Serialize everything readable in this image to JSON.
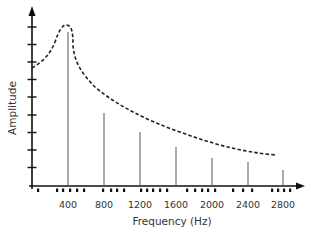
{
  "chart_data": {
    "type": "line",
    "title": "",
    "xlabel": "Frequency (Hz)",
    "ylabel": "Amplitude",
    "xticks": [
      400,
      800,
      1200,
      1600,
      2000,
      2400,
      2800
    ],
    "xtick_labels": [
      "400",
      "800",
      "1200",
      "1600",
      "2000",
      "2400",
      "2800"
    ],
    "y_tick_count": 9,
    "y_tick_labels": [],
    "grid": false,
    "legend": null,
    "series": [
      {
        "name": "envelope",
        "style": "dashed",
        "description": "Resonance envelope curve peaking near 400 Hz and decaying toward higher frequencies",
        "x": [
          0,
          100,
          200,
          300,
          360,
          400,
          440,
          500,
          600,
          800,
          1000,
          1200,
          1600,
          2000,
          2400,
          2700
        ],
        "y": [
          6.8,
          7.2,
          7.9,
          8.7,
          9.1,
          9.1,
          8.3,
          6.9,
          5.6,
          4.3,
          3.6,
          3.1,
          2.4,
          1.9,
          1.6,
          1.5
        ]
      },
      {
        "name": "harmonics",
        "style": "stem",
        "description": "Vertical lines at harmonic frequencies (multiples of 400 Hz)",
        "x": [
          400,
          800,
          1200,
          1600,
          2000,
          2400,
          2800
        ],
        "y": [
          8.8,
          4.2,
          3.1,
          2.2,
          1.6,
          1.3,
          0.9
        ]
      }
    ],
    "xlim": [
      0,
      3000
    ],
    "ylim": [
      0,
      10
    ]
  },
  "axes": {
    "x_title": "Frequency (Hz)",
    "y_title": "Amplitude"
  }
}
